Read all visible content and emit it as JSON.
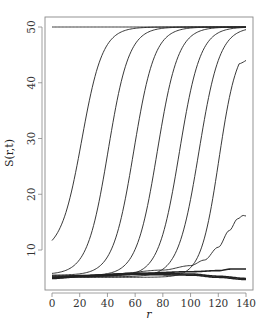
{
  "chart_data": {
    "type": "line",
    "title": "",
    "xlabel": "r",
    "ylabel": "S(r,t)",
    "xlim": [
      -5,
      145
    ],
    "ylim": [
      3.5,
      51.5
    ],
    "xticks": [
      0,
      20,
      40,
      60,
      80,
      100,
      120,
      140
    ],
    "yticks": [
      10,
      20,
      30,
      40,
      50
    ],
    "grid": false,
    "legend": null,
    "line_color": "#222222",
    "series": [
      {
        "name": "t1",
        "kind": "flat",
        "x": [
          0,
          140
        ],
        "y": [
          50,
          50
        ]
      },
      {
        "name": "t2",
        "kind": "sigmoid",
        "start": 11.7,
        "upper": 50,
        "midpoint": 21.5,
        "width": 7.5
      },
      {
        "name": "t3",
        "kind": "sigmoid",
        "start": 5.8,
        "upper": 50,
        "midpoint": 40.5,
        "width": 7.5
      },
      {
        "name": "t4",
        "kind": "sigmoid",
        "start": 5.5,
        "upper": 50,
        "midpoint": 59,
        "width": 7.5
      },
      {
        "name": "t5",
        "kind": "sigmoid",
        "start": 5.4,
        "upper": 50,
        "midpoint": 76,
        "width": 7.5
      },
      {
        "name": "t6",
        "kind": "sigmoid",
        "start": 5.3,
        "upper": 50,
        "midpoint": 92,
        "width": 7.5
      },
      {
        "name": "t7",
        "kind": "sigmoid",
        "start": 5.2,
        "upper": 50,
        "midpoint": 106,
        "width": 7.5
      },
      {
        "name": "t8",
        "kind": "sigmoid_peak",
        "start": 5.1,
        "upper": 47.5,
        "midpoint": 120.5,
        "width": 6.5,
        "peak_x": 135,
        "end_y": 44
      },
      {
        "name": "t9",
        "kind": "bump",
        "x": [
          0,
          40,
          80,
          100,
          110,
          120,
          128,
          134,
          138,
          140
        ],
        "y": [
          5.0,
          5.6,
          6.4,
          7.2,
          8.2,
          10.5,
          13.5,
          15.6,
          16.2,
          16.1
        ]
      },
      {
        "name": "t10",
        "kind": "low",
        "x": [
          0,
          20,
          60,
          100,
          120,
          130,
          140
        ],
        "y": [
          5.0,
          5.3,
          5.8,
          6.1,
          6.3,
          6.6,
          6.6
        ]
      },
      {
        "name": "t11",
        "kind": "low",
        "x": [
          0,
          20,
          60,
          100,
          120,
          140
        ],
        "y": [
          5.1,
          5.4,
          5.8,
          5.7,
          5.3,
          4.9
        ]
      },
      {
        "name": "t12",
        "kind": "low",
        "x": [
          0,
          20,
          60,
          100,
          120,
          140
        ],
        "y": [
          4.9,
          5.2,
          5.6,
          5.5,
          5.1,
          4.7
        ]
      }
    ]
  }
}
